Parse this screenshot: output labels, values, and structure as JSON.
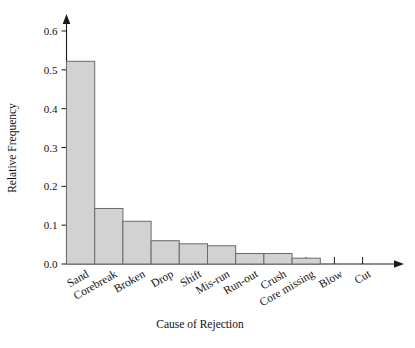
{
  "chart_data": {
    "type": "bar",
    "title": "",
    "subtitle": "",
    "xlabel": "Cause of Rejection",
    "ylabel": "Relative Frequency",
    "categories": [
      "Sand",
      "Corebreak",
      "Broken",
      "Drop",
      "Shift",
      "Mis-run",
      "Run-out",
      "Crush",
      "Core missing",
      "Blow",
      "Cut"
    ],
    "values": [
      0.522,
      0.143,
      0.11,
      0.06,
      0.052,
      0.047,
      0.027,
      0.027,
      0.015,
      0.0,
      0.0
    ],
    "ylim": [
      0.0,
      0.65
    ],
    "ytick_labels": [
      "0.0",
      "0.1",
      "0.2",
      "0.3",
      "0.4",
      "0.5",
      "0.6"
    ],
    "ytick_values": [
      0.0,
      0.1,
      0.2,
      0.3,
      0.4,
      0.5,
      0.6
    ],
    "grid": false,
    "legend": null,
    "legend_position": "none",
    "bar_fill_color": "#d2d2d2",
    "bar_edge_color": "#6a6a6a",
    "axis_color": "#1a1a1a",
    "xtick_label_rotation": 30,
    "annotations": []
  }
}
